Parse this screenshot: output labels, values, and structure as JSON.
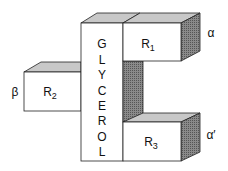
{
  "diagram": {
    "glycerol_letters": [
      "G",
      "L",
      "Y",
      "C",
      "E",
      "R",
      "O",
      "L"
    ],
    "r1": {
      "label": "R",
      "sub": "1",
      "position": "α"
    },
    "r2": {
      "label": "R",
      "sub": "2",
      "position": "β"
    },
    "r3": {
      "label": "R",
      "sub": "3",
      "position": "α′"
    },
    "colors": {
      "face": "#ffffff",
      "top": "#c8c8c8",
      "shade": "#777777",
      "stroke": "#222222"
    }
  }
}
